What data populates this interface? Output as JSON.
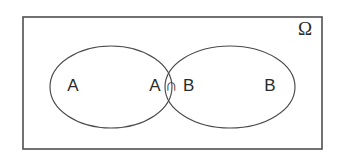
{
  "figure": {
    "background_color": "#ffffff",
    "stroke_color": "#4a4a4a",
    "frame_stroke_color": "#4f4f4f",
    "text_color": "#2b2b2b"
  },
  "universe": {
    "label": "Ω",
    "label_name": "omega",
    "rect": {
      "x": 23,
      "y": 17,
      "width": 299,
      "height": 132
    },
    "label_position": {
      "x": 305,
      "y": 31
    }
  },
  "sets": [
    {
      "id": "set-a",
      "label": "A",
      "center": {
        "x": 111,
        "y": 87
      },
      "rx": 61,
      "ry": 41,
      "label_position": {
        "x": 73,
        "y": 87
      }
    },
    {
      "id": "set-b",
      "label": "B",
      "center": {
        "x": 230,
        "y": 87
      },
      "rx": 65,
      "ry": 41,
      "label_position": {
        "x": 270,
        "y": 87
      }
    }
  ],
  "intersection": {
    "id": "set-a-intersect-b",
    "label": "A ∩ B",
    "label_position": {
      "x": 172,
      "y": 87
    }
  }
}
